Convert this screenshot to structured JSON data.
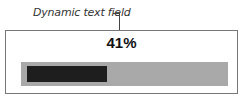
{
  "annotation": {
    "label": "Dynamic text field"
  },
  "progress": {
    "value_text": "41%",
    "value": 41,
    "colors": {
      "track": "#a9a9a9",
      "fill": "#1e1e1e",
      "frame": "#777777"
    }
  }
}
